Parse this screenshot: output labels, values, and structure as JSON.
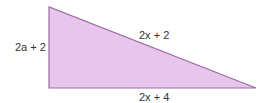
{
  "diagram": {
    "shape": "right triangle",
    "fill_color": "#e8c6ec",
    "stroke_color": "#9c6aa3",
    "vertices": [
      [
        49,
        7
      ],
      [
        49,
        88
      ],
      [
        256,
        88
      ]
    ],
    "labels": {
      "left_side": "2a + 2",
      "hypotenuse": "2x + 2",
      "bottom_side": "2x + 4"
    }
  }
}
